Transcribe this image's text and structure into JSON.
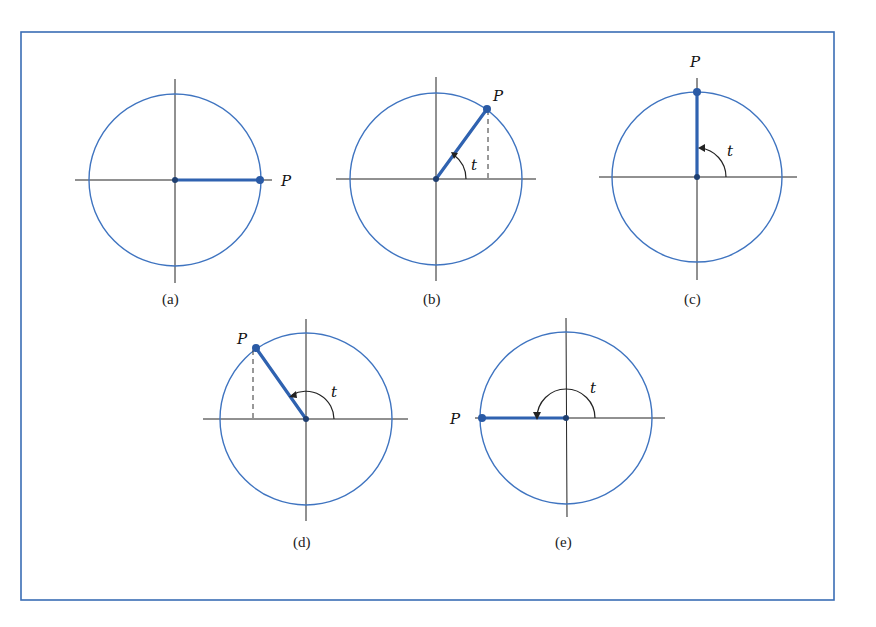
{
  "figure": {
    "frame_color": "#3a6db5",
    "circle_color": "#3f74c0",
    "radius_color": "#2f62b0",
    "panels": [
      {
        "id": "a",
        "caption": "(a)",
        "point_label": "P",
        "angle_label": "",
        "angle_deg": 0
      },
      {
        "id": "b",
        "caption": "(b)",
        "point_label": "P",
        "angle_label": "t",
        "angle_deg": 55
      },
      {
        "id": "c",
        "caption": "(c)",
        "point_label": "P",
        "angle_label": "t",
        "angle_deg": 90
      },
      {
        "id": "d",
        "caption": "(d)",
        "point_label": "P",
        "angle_label": "t",
        "angle_deg": 126
      },
      {
        "id": "e",
        "caption": "(e)",
        "point_label": "P",
        "angle_label": "t",
        "angle_deg": 180
      }
    ]
  }
}
